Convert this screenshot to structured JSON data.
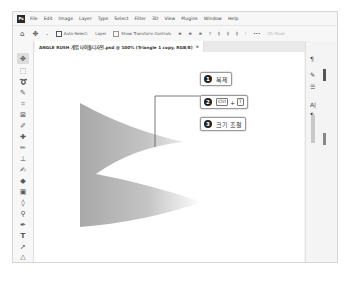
{
  "app": {
    "logo": "Ps",
    "menu": [
      "File",
      "Edit",
      "Image",
      "Layer",
      "Type",
      "Select",
      "Filter",
      "3D",
      "View",
      "Plugins",
      "Window",
      "Help"
    ]
  },
  "options_bar": {
    "home_icon": "home-icon",
    "move_icon": "move-icon",
    "auto_select": "Auto-Select:",
    "layer_select": "Layer",
    "show_transform": "Show Transform Controls",
    "more": "•••",
    "share": "3D Mode"
  },
  "document_tab": {
    "title": "ANGLE RUSH 게임 타이틀디자인.psd @ 100% (Triangle 1 copy, RGB/8)",
    "close": "×"
  },
  "tools": [
    "move",
    "marquee",
    "lasso",
    "quick-select",
    "crop",
    "frame",
    "eyedropper",
    "healing",
    "brush",
    "stamp",
    "history-brush",
    "eraser",
    "gradient",
    "blur",
    "dodge",
    "pen",
    "path-select",
    "type",
    "direct-select",
    "shape",
    "hand"
  ],
  "right_panel": {
    "icons": [
      "paragraph-icon",
      "brush-settings-icon",
      "adjustments-icon",
      "character-icon",
      "paragraph-style-icon"
    ]
  },
  "callouts": [
    {
      "num": "1",
      "label": "복제"
    },
    {
      "num": "2",
      "key1": "Ctrl",
      "plus": "+",
      "key2": "T"
    },
    {
      "num": "3",
      "label": "크기 조절"
    }
  ],
  "colors": {
    "shape_dark": "#a8a8a8",
    "shape_light": "#ffffff",
    "frame_border": "#d6d6d6"
  }
}
